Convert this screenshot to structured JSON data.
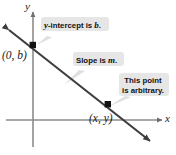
{
  "figure": {
    "axes": {
      "y_label": "y",
      "x_label": "x",
      "x_axis_name": "x-axis",
      "y_axis_name": "y-axis",
      "axis_color": "#8c8c8c"
    },
    "line": {
      "name": "graph-line",
      "color": "#3d3d3d",
      "description": "descending line with arrowheads at both ends"
    },
    "points": [
      {
        "id": "y-intercept-point",
        "label": "(0, b)",
        "marker": "filled-square"
      },
      {
        "id": "arbitrary-point",
        "label": "(x, y)",
        "marker": "filled-square"
      }
    ],
    "callouts": [
      {
        "id": "callout-y-intercept",
        "text_plain": "y-intercept is b.",
        "text_lead": "y",
        "text_mid": "-intercept is ",
        "text_tail": "b",
        "text_end": ".",
        "bg": "#e6e6e6"
      },
      {
        "id": "callout-slope",
        "text_plain": "Slope is m.",
        "text_mid": "Slope is ",
        "text_tail": "m",
        "text_end": ".",
        "bg": "#e6e6e6"
      },
      {
        "id": "callout-arbitrary",
        "text_plain": "This point is arbitrary.",
        "line1": "This point",
        "line2": "is arbitrary.",
        "bg": "#e6e6e6"
      }
    ]
  }
}
